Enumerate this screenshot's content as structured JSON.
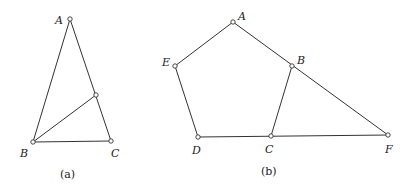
{
  "figures": [
    {
      "caption": "(a)",
      "points": {
        "A": "A",
        "B": "B",
        "C": "C"
      }
    },
    {
      "caption": "(b)",
      "points": {
        "A": "A",
        "B": "B",
        "C": "C",
        "D": "D",
        "E": "E",
        "F": "F"
      }
    }
  ]
}
